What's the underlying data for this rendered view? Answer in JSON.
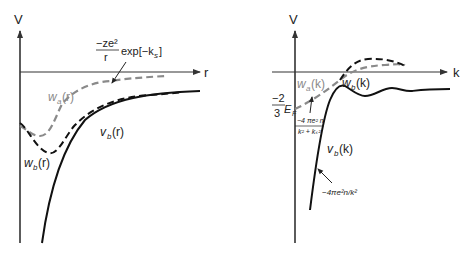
{
  "colors": {
    "axis": "#333333",
    "black_curve": "#111111",
    "gray_curve": "#8a8a8a",
    "background": "#ffffff"
  },
  "left_panel": {
    "y_axis_label": "V",
    "x_axis_label": "r",
    "formula_numerator": "−ze²",
    "formula_denominator": "r",
    "formula_exp": "exp[−k",
    "formula_exp_sub": "s",
    "formula_exp_close": "]",
    "curve_labels": {
      "wa": "w",
      "wa_sub": "a",
      "wa_arg": "(r)",
      "wb": "w",
      "wb_sub": "b",
      "wb_arg": "(r)",
      "vb": "v",
      "vb_sub": "b",
      "vb_arg": "(r)"
    }
  },
  "right_panel": {
    "y_axis_label": "V",
    "x_axis_label": "k",
    "ef_numerator": "−2",
    "ef_denominator": "3",
    "ef_symbol": "E",
    "ef_sub": "F",
    "small_formula_numerator": "−4 πe² n",
    "small_formula_denominator": "k² + kₛ²",
    "asymptote_formula": "−4πe²n/k²",
    "curve_labels": {
      "wa": "w",
      "wa_sub": "a",
      "wa_arg": "(k)",
      "wb": "w",
      "wb_sub": "b",
      "wb_arg": "(k)",
      "vb": "v",
      "vb_sub": "b",
      "vb_arg": "(k)"
    }
  }
}
